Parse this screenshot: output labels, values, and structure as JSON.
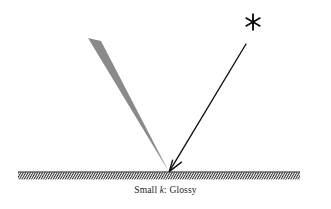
{
  "figure": {
    "name": "glossy-reflection-diagram",
    "caption_prefix": "Small ",
    "caption_variable": "k",
    "caption_suffix": ": Glossy",
    "caption_full": "Small k: Glossy",
    "background_color": "#ffffff"
  },
  "light_source": {
    "icon": "asterisk-star-icon",
    "glyph": "✳",
    "x": 253,
    "y": 22,
    "color": "#111111",
    "spokes": 6
  },
  "incident_ray": {
    "label": "incident-ray",
    "from_x": 246,
    "from_y": 44,
    "to_x": 169,
    "to_y": 172,
    "color": "#141414",
    "width": 1.4,
    "arrowhead": "v-arrow-down-left"
  },
  "surface": {
    "label": "ground-surface",
    "x_start": 18,
    "x_end": 300,
    "y": 172,
    "line_color": "#1a1a1a",
    "line_width": 1.2,
    "hatch_color": "#2b2b2b",
    "hatch_depth": 7,
    "hatch_spacing": 2.4
  },
  "reflection_lobe": {
    "label": "glossy-specular-lobe",
    "apex_x": 169,
    "apex_y": 172,
    "top_left_x": 88,
    "top_left_y": 38,
    "top_right_x": 101,
    "top_right_y": 41,
    "fill_color": "#8a8a8a"
  }
}
